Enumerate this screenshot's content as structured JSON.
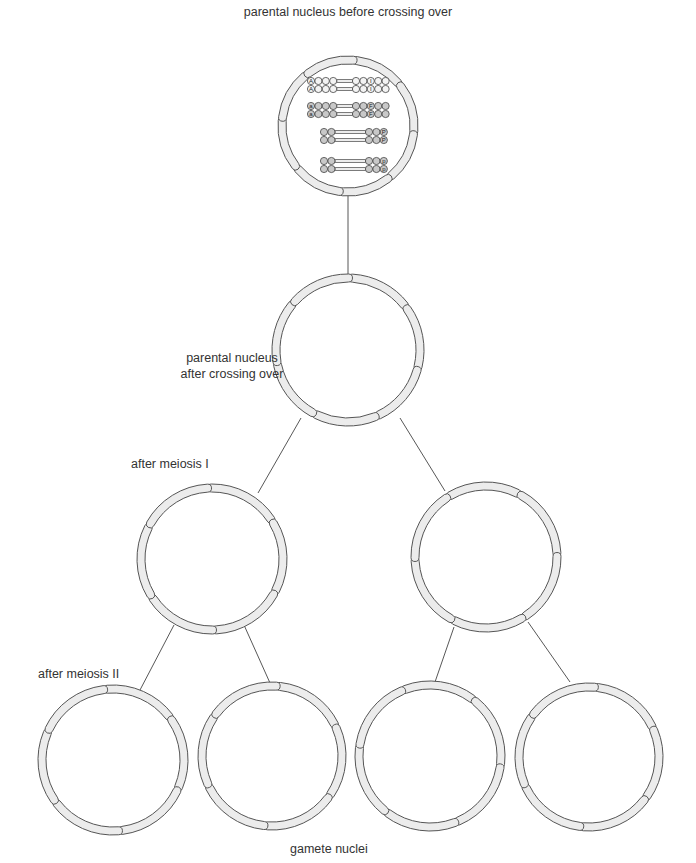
{
  "labels": {
    "top": "parental nucleus before crossing over",
    "parental_after": "parental nucleus",
    "parental_after_2": "after crossing over",
    "meiosis1": "after meiosis I",
    "meiosis2": "after meiosis II",
    "gametes": "gamete nuclei"
  },
  "nuclei": [
    {
      "id": "parent-before",
      "stage": "before crossing over",
      "segments": 8,
      "contains_chromosomes": true
    },
    {
      "id": "parent-after",
      "stage": "after crossing over",
      "segments": 7
    },
    {
      "id": "meiosis1-left",
      "stage": "after meiosis I",
      "segments": 6
    },
    {
      "id": "meiosis1-right",
      "stage": "after meiosis I",
      "segments": 6
    },
    {
      "id": "gamete-1",
      "stage": "gamete",
      "segments": 6
    },
    {
      "id": "gamete-2",
      "stage": "gamete",
      "segments": 6
    },
    {
      "id": "gamete-3",
      "stage": "gamete",
      "segments": 6
    },
    {
      "id": "gamete-4",
      "stage": "gamete",
      "segments": 6
    }
  ],
  "chromosome_pairs": [
    {
      "shade": "light",
      "left_beads": 4,
      "right_beads": 5,
      "left_allele": "A",
      "right_allele": "I",
      "right_allele_pos": 3
    },
    {
      "shade": "dark",
      "left_beads": 4,
      "right_beads": 5,
      "left_allele": "a",
      "right_allele": "F",
      "right_allele_pos": 3
    },
    {
      "shade": "dark",
      "left_beads": 2,
      "right_beads": 3,
      "left_allele": "",
      "right_allele": "P",
      "right_allele_pos": 3
    },
    {
      "shade": "dark",
      "left_beads": 2,
      "right_beads": 3,
      "left_allele": "",
      "right_allele": "p",
      "right_allele_pos": 3
    }
  ],
  "colors": {
    "membrane_fill": "#ececec",
    "outline": "#555555",
    "dark_bead": "#c8c8c8",
    "light_bead": "#f3f3f3"
  }
}
